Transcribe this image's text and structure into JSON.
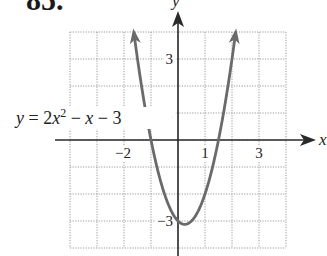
{
  "problem_number": "85.",
  "chart_data": {
    "type": "line",
    "title": "",
    "equation_label": "y = 2x^2 - x - 3",
    "equation_parts": {
      "lhs": "y",
      "eq": " = 2",
      "x1": "x",
      "sup": "2",
      "minus1": " − ",
      "x2": "x",
      "minus2": " − 3"
    },
    "xlabel": "x",
    "ylabel": "y",
    "xlim": [
      -4,
      4
    ],
    "ylim": [
      -4,
      4
    ],
    "grid": true,
    "grid_step": 1,
    "x_tick_labels": [
      {
        "value": -2,
        "label": "−2"
      },
      {
        "value": 1,
        "label": "1"
      },
      {
        "value": 3,
        "label": "3"
      }
    ],
    "y_tick_labels": [
      {
        "value": 3,
        "label": "3"
      },
      {
        "value": 1,
        "label": "1"
      },
      {
        "value": -3,
        "label": "−3"
      }
    ],
    "function": {
      "a": 2,
      "b": -1,
      "c": -3
    },
    "series": [
      {
        "name": "y = 2x^2 - x - 3",
        "x": [
          -1.63,
          -1.5,
          -1.25,
          -1,
          -0.75,
          -0.5,
          -0.25,
          0,
          0.25,
          0.5,
          0.75,
          1,
          1.25,
          1.5,
          1.75,
          2,
          2.13
        ],
        "y": [
          4.0,
          3.0,
          1.375,
          0,
          -1.125,
          -2.0,
          -2.625,
          -3.0,
          -3.125,
          -3.0,
          -2.625,
          -2.0,
          -1.125,
          0,
          1.375,
          3.0,
          3.94
        ]
      }
    ],
    "key_points": {
      "vertex": [
        0.25,
        -3.125
      ],
      "x_intercepts": [
        -1,
        1.5
      ],
      "y_intercept": -3
    },
    "colors": {
      "curve": "#6a6a6a",
      "axes": "#2a2a2a",
      "grid": "#9a9a9a"
    }
  }
}
